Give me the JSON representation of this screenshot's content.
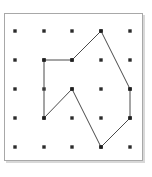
{
  "figure": {
    "background_color": "#ffffff",
    "frame_color": "#a8a8a8",
    "dot_color": "#2b2b2b",
    "line_color": "#4a4a4a"
  },
  "board": {
    "name": "geoboard",
    "rows": 5,
    "columns": 5,
    "origin_px": {
      "x": 15,
      "y": 31
    },
    "spacing_px": {
      "x": 28.75,
      "y": 29
    },
    "frame_px": {
      "left": 4,
      "top": 13,
      "width": 139,
      "height": 148
    },
    "dot_radius_px": 1.7
  },
  "chart_data": {
    "type": "scatter",
    "xlabel": "",
    "ylabel": "",
    "grid": true,
    "legend": "none",
    "xlim": [
      0,
      4
    ],
    "ylim": [
      0,
      4
    ],
    "grid_points": [
      {
        "col": 0,
        "row": 0,
        "x_px": 15,
        "y_px": 31
      },
      {
        "col": 1,
        "row": 0,
        "x_px": 44,
        "y_px": 31
      },
      {
        "col": 2,
        "row": 0,
        "x_px": 72,
        "y_px": 31
      },
      {
        "col": 3,
        "row": 0,
        "x_px": 101,
        "y_px": 31
      },
      {
        "col": 4,
        "row": 0,
        "x_px": 130,
        "y_px": 31
      },
      {
        "col": 0,
        "row": 1,
        "x_px": 15,
        "y_px": 60
      },
      {
        "col": 1,
        "row": 1,
        "x_px": 44,
        "y_px": 60
      },
      {
        "col": 2,
        "row": 1,
        "x_px": 72,
        "y_px": 60
      },
      {
        "col": 3,
        "row": 1,
        "x_px": 101,
        "y_px": 60
      },
      {
        "col": 4,
        "row": 1,
        "x_px": 130,
        "y_px": 60
      },
      {
        "col": 0,
        "row": 2,
        "x_px": 15,
        "y_px": 89
      },
      {
        "col": 1,
        "row": 2,
        "x_px": 44,
        "y_px": 89
      },
      {
        "col": 2,
        "row": 2,
        "x_px": 72,
        "y_px": 89
      },
      {
        "col": 3,
        "row": 2,
        "x_px": 101,
        "y_px": 89
      },
      {
        "col": 4,
        "row": 2,
        "x_px": 130,
        "y_px": 89
      },
      {
        "col": 0,
        "row": 3,
        "x_px": 15,
        "y_px": 118
      },
      {
        "col": 1,
        "row": 3,
        "x_px": 44,
        "y_px": 118
      },
      {
        "col": 2,
        "row": 3,
        "x_px": 72,
        "y_px": 118
      },
      {
        "col": 3,
        "row": 3,
        "x_px": 101,
        "y_px": 118
      },
      {
        "col": 4,
        "row": 3,
        "x_px": 130,
        "y_px": 118
      },
      {
        "col": 0,
        "row": 4,
        "x_px": 15,
        "y_px": 147
      },
      {
        "col": 1,
        "row": 4,
        "x_px": 44,
        "y_px": 147
      },
      {
        "col": 2,
        "row": 4,
        "x_px": 72,
        "y_px": 147
      },
      {
        "col": 3,
        "row": 4,
        "x_px": 101,
        "y_px": 147
      },
      {
        "col": 4,
        "row": 4,
        "x_px": 130,
        "y_px": 147
      }
    ],
    "polygon": {
      "name": "arrow-polygon",
      "closed": true,
      "vertex_count": 8,
      "vertices_grid": [
        {
          "col": 1,
          "row": 1
        },
        {
          "col": 2,
          "row": 1
        },
        {
          "col": 3,
          "row": 0
        },
        {
          "col": 4,
          "row": 2
        },
        {
          "col": 4,
          "row": 3
        },
        {
          "col": 3,
          "row": 4
        },
        {
          "col": 2,
          "row": 2
        },
        {
          "col": 1,
          "row": 3
        }
      ],
      "vertices_px": [
        {
          "x": 44,
          "y": 60
        },
        {
          "x": 72,
          "y": 60
        },
        {
          "x": 101,
          "y": 31
        },
        {
          "x": 130,
          "y": 89
        },
        {
          "x": 130,
          "y": 118
        },
        {
          "x": 101,
          "y": 147
        },
        {
          "x": 72,
          "y": 89
        },
        {
          "x": 44,
          "y": 118
        }
      ],
      "points_attr": "44,60 72,60 101,31 130,89 130,118 101,147 72,89 44,118",
      "stroke_color": "#4a4a4a",
      "stroke_width": 1,
      "fill": "none"
    }
  }
}
